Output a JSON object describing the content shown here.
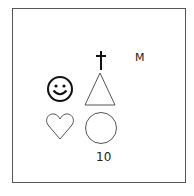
{
  "figure": {
    "symbols": [
      {
        "name": "dagger",
        "glyph": "†"
      },
      {
        "name": "smiley-face"
      },
      {
        "name": "triangle"
      },
      {
        "name": "heart"
      },
      {
        "name": "circle"
      }
    ],
    "letter": "M",
    "number": "10"
  }
}
